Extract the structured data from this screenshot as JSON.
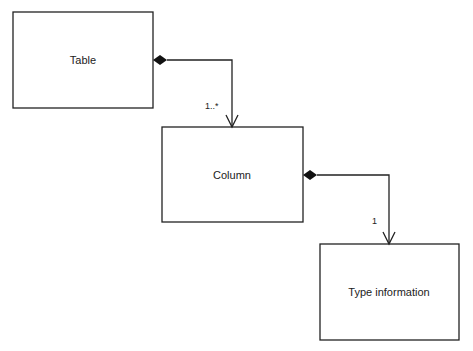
{
  "diagram": {
    "type": "uml-class-composition",
    "classes": [
      {
        "id": "table",
        "label": "Table",
        "x": 13,
        "y": 12,
        "w": 140,
        "h": 96
      },
      {
        "id": "column",
        "label": "Column",
        "x": 162,
        "y": 127,
        "w": 141,
        "h": 95
      },
      {
        "id": "type_information",
        "label": "Type information",
        "x": 320,
        "y": 244,
        "w": 139,
        "h": 96
      }
    ],
    "relations": [
      {
        "from": "table",
        "to": "column",
        "kind": "composition",
        "multiplicity": "1..*"
      },
      {
        "from": "column",
        "to": "type_information",
        "kind": "composition",
        "multiplicity": "1"
      }
    ]
  }
}
